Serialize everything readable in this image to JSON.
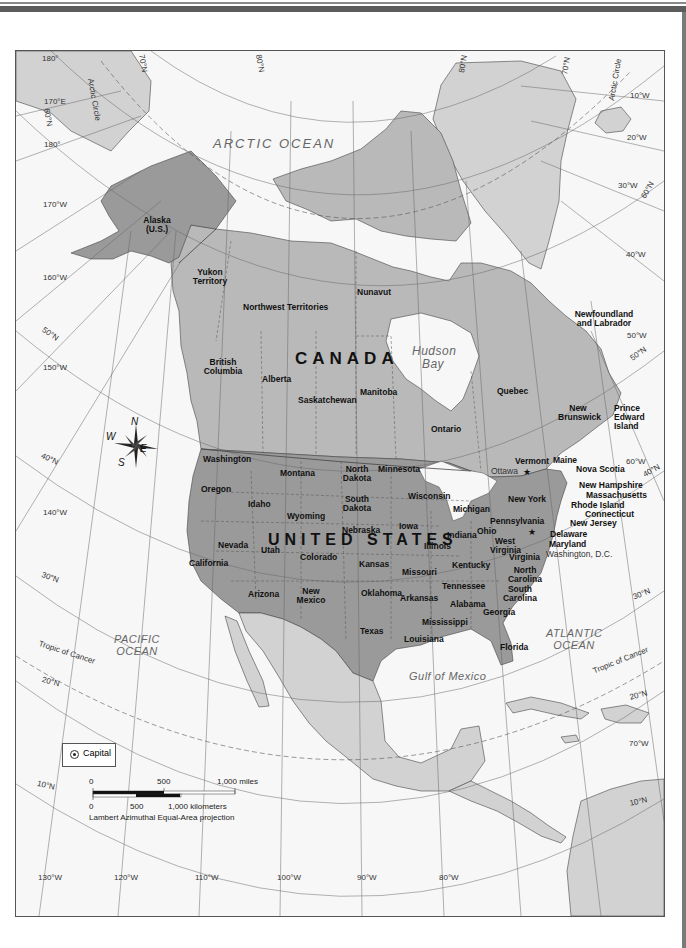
{
  "map": {
    "title": "North America political map",
    "projection": "Lambert Azimuthal Equal-Area projection",
    "countries": [
      {
        "name": "CANADA",
        "x": 295,
        "y": 358
      },
      {
        "name": "UNITED STATES",
        "x": 268,
        "y": 532
      }
    ],
    "provinces_territories": [
      {
        "name": "Yukon Territory",
        "x": 190,
        "y": 268
      },
      {
        "name": "Northwest Territories",
        "x": 243,
        "y": 303
      },
      {
        "name": "Nunavut",
        "x": 357,
        "y": 288
      },
      {
        "name": "British Columbia",
        "x": 203,
        "y": 358
      },
      {
        "name": "Alberta",
        "x": 262,
        "y": 375
      },
      {
        "name": "Saskatchewan",
        "x": 298,
        "y": 396
      },
      {
        "name": "Manitoba",
        "x": 360,
        "y": 388
      },
      {
        "name": "Ontario",
        "x": 431,
        "y": 425
      },
      {
        "name": "Quebec",
        "x": 497,
        "y": 387
      },
      {
        "name": "Newfoundland and Labrador",
        "x": 571,
        "y": 310
      },
      {
        "name": "New Brunswick",
        "x": 562,
        "y": 404
      },
      {
        "name": "Prince Edward Island",
        "x": 616,
        "y": 404
      },
      {
        "name": "Nova Scotia",
        "x": 576,
        "y": 465
      }
    ],
    "states": [
      {
        "name": "Alaska (U.S.)",
        "x": 144,
        "y": 216
      },
      {
        "name": "Washington",
        "x": 203,
        "y": 455
      },
      {
        "name": "Oregon",
        "x": 201,
        "y": 485
      },
      {
        "name": "Idaho",
        "x": 248,
        "y": 500
      },
      {
        "name": "Montana",
        "x": 280,
        "y": 469
      },
      {
        "name": "Wyoming",
        "x": 287,
        "y": 512
      },
      {
        "name": "North Dakota",
        "x": 342,
        "y": 465
      },
      {
        "name": "South Dakota",
        "x": 342,
        "y": 495
      },
      {
        "name": "Minnesota",
        "x": 378,
        "y": 465
      },
      {
        "name": "Wisconsin",
        "x": 408,
        "y": 492
      },
      {
        "name": "Michigan",
        "x": 453,
        "y": 505
      },
      {
        "name": "Nebraska",
        "x": 342,
        "y": 526
      },
      {
        "name": "Iowa",
        "x": 399,
        "y": 522
      },
      {
        "name": "Illinois",
        "x": 424,
        "y": 542
      },
      {
        "name": "Indiana",
        "x": 447,
        "y": 531
      },
      {
        "name": "Ohio",
        "x": 477,
        "y": 527
      },
      {
        "name": "Pennsylvania",
        "x": 493,
        "y": 517
      },
      {
        "name": "New York",
        "x": 508,
        "y": 495
      },
      {
        "name": "Vermont",
        "x": 515,
        "y": 457
      },
      {
        "name": "Maine",
        "x": 553,
        "y": 456
      },
      {
        "name": "New Hampshire",
        "x": 579,
        "y": 481
      },
      {
        "name": "Massachusetts",
        "x": 586,
        "y": 491
      },
      {
        "name": "Rhode Island",
        "x": 571,
        "y": 501
      },
      {
        "name": "Connecticut",
        "x": 585,
        "y": 510
      },
      {
        "name": "New Jersey",
        "x": 570,
        "y": 519
      },
      {
        "name": "Delaware",
        "x": 550,
        "y": 530
      },
      {
        "name": "Maryland",
        "x": 549,
        "y": 540
      },
      {
        "name": "West Virginia",
        "x": 493,
        "y": 537
      },
      {
        "name": "Virginia",
        "x": 509,
        "y": 553
      },
      {
        "name": "Kentucky",
        "x": 452,
        "y": 561
      },
      {
        "name": "Tennessee",
        "x": 442,
        "y": 582
      },
      {
        "name": "North Carolina",
        "x": 509,
        "y": 566
      },
      {
        "name": "South Carolina",
        "x": 503,
        "y": 585
      },
      {
        "name": "Georgia",
        "x": 483,
        "y": 608
      },
      {
        "name": "Alabama",
        "x": 450,
        "y": 600
      },
      {
        "name": "Mississippi",
        "x": 422,
        "y": 618
      },
      {
        "name": "Louisiana",
        "x": 404,
        "y": 635
      },
      {
        "name": "Florida",
        "x": 500,
        "y": 643
      },
      {
        "name": "Arkansas",
        "x": 400,
        "y": 594
      },
      {
        "name": "Missouri",
        "x": 402,
        "y": 568
      },
      {
        "name": "Kansas",
        "x": 359,
        "y": 560
      },
      {
        "name": "Oklahoma",
        "x": 361,
        "y": 589
      },
      {
        "name": "Texas",
        "x": 360,
        "y": 627
      },
      {
        "name": "Colorado",
        "x": 300,
        "y": 553
      },
      {
        "name": "New Mexico",
        "x": 296,
        "y": 587
      },
      {
        "name": "Utah",
        "x": 261,
        "y": 546
      },
      {
        "name": "Arizona",
        "x": 248,
        "y": 590
      },
      {
        "name": "Nevada",
        "x": 218,
        "y": 541
      },
      {
        "name": "California",
        "x": 189,
        "y": 559
      }
    ],
    "capitals": [
      {
        "name": "Ottawa",
        "x": 491,
        "y": 471
      },
      {
        "name": "Washington, D.C.",
        "x": 546,
        "y": 552
      }
    ],
    "water_bodies": [
      {
        "name": "ARCTIC OCEAN",
        "x": 213,
        "y": 137
      },
      {
        "name": "Hudson Bay",
        "x": 412,
        "y": 347
      },
      {
        "name": "PACIFIC OCEAN",
        "x": 117,
        "y": 634
      },
      {
        "name": "ATLANTIC OCEAN",
        "x": 549,
        "y": 628
      },
      {
        "name": "Gulf of Mexico",
        "x": 409,
        "y": 675
      }
    ],
    "lines": [
      {
        "name": "Arctic Circle",
        "x": 100,
        "y": 85
      },
      {
        "name": "Arctic Circle",
        "x": 606,
        "y": 100
      },
      {
        "name": "Tropic of Cancer",
        "x": 40,
        "y": 654
      },
      {
        "name": "Tropic of Cancer",
        "x": 585,
        "y": 667
      }
    ],
    "graticule_labels": [
      {
        "text": "180°",
        "x": 42,
        "y": 57
      },
      {
        "text": "70°N",
        "x": 144,
        "y": 60
      },
      {
        "text": "80°N",
        "x": 252,
        "y": 60
      },
      {
        "text": "80°N",
        "x": 460,
        "y": 60
      },
      {
        "text": "70°N",
        "x": 563,
        "y": 60
      },
      {
        "text": "170°E",
        "x": 44,
        "y": 98
      },
      {
        "text": "60°N",
        "x": 48,
        "y": 108
      },
      {
        "text": "180°",
        "x": 44,
        "y": 143
      },
      {
        "text": "10°W",
        "x": 630,
        "y": 94
      },
      {
        "text": "20°W",
        "x": 627,
        "y": 136
      },
      {
        "text": "30°W",
        "x": 618,
        "y": 184
      },
      {
        "text": "60°N",
        "x": 648,
        "y": 188
      },
      {
        "text": "170°W",
        "x": 43,
        "y": 203
      },
      {
        "text": "40°W",
        "x": 626,
        "y": 253
      },
      {
        "text": "160°W",
        "x": 43,
        "y": 276
      },
      {
        "text": "50°N",
        "x": 45,
        "y": 330
      },
      {
        "text": "50°W",
        "x": 627,
        "y": 334
      },
      {
        "text": "50°N",
        "x": 629,
        "y": 351
      },
      {
        "text": "150°W",
        "x": 43,
        "y": 366
      },
      {
        "text": "60°W",
        "x": 626,
        "y": 460
      },
      {
        "text": "40°N",
        "x": 642,
        "y": 467
      },
      {
        "text": "40°N",
        "x": 43,
        "y": 456
      },
      {
        "text": "140°W",
        "x": 43,
        "y": 511
      },
      {
        "text": "30°N",
        "x": 43,
        "y": 575
      },
      {
        "text": "30°N",
        "x": 632,
        "y": 590
      },
      {
        "text": "20°N",
        "x": 43,
        "y": 680
      },
      {
        "text": "20°N",
        "x": 629,
        "y": 690
      },
      {
        "text": "70°W",
        "x": 629,
        "y": 742
      },
      {
        "text": "10°N",
        "x": 38,
        "y": 783
      },
      {
        "text": "10°N",
        "x": 629,
        "y": 798
      },
      {
        "text": "130°W",
        "x": 38,
        "y": 876
      },
      {
        "text": "120°W",
        "x": 114,
        "y": 876
      },
      {
        "text": "110°W",
        "x": 195,
        "y": 876
      },
      {
        "text": "100°W",
        "x": 277,
        "y": 876
      },
      {
        "text": "90°W",
        "x": 357,
        "y": 876
      },
      {
        "text": "80°W",
        "x": 439,
        "y": 876
      }
    ],
    "compass": {
      "n": "N",
      "s": "S",
      "e": "E",
      "w": "W"
    },
    "legend": {
      "capital_label": "Capital",
      "scale_miles": {
        "ticks": [
          "0",
          "500",
          "1,000 miles"
        ]
      },
      "scale_km": {
        "ticks": [
          "0",
          "500",
          "1,000 kilometers"
        ]
      }
    },
    "colors": {
      "us_fill": "#9a9a9a",
      "canada_fill": "#b9b9b9",
      "other_land_fill": "#d2d2d2",
      "water": "#f7f7f7",
      "grid_line": "#666666",
      "coast": "#444444"
    }
  }
}
